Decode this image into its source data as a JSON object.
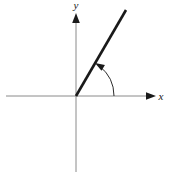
{
  "figure": {
    "background_color": "#ffffff",
    "width": 169,
    "height": 177,
    "axis_color": "#8a8a8a",
    "ray_color": "#1a1a1a",
    "arc_color": "#2b2b2b",
    "label_color": "#1a1a1a"
  },
  "axes": {
    "x_axis": {
      "label": "x",
      "label_x": 161,
      "label_y": 100,
      "start_x": 6,
      "end_x": 150,
      "y": 96,
      "arrow_tip_x": 156,
      "has_arrow": true
    },
    "y_axis": {
      "label": "y",
      "label_x": 76,
      "label_y": 9,
      "x": 76,
      "start_y": 172,
      "end_y": 20,
      "arrow_tip_y": 13,
      "has_arrow": true
    },
    "origin": {
      "x": 76,
      "y": 96,
      "label": ""
    }
  },
  "ray": {
    "name": "terminal-side",
    "from_x": 76,
    "from_y": 96,
    "to_x": 126,
    "to_y": 10,
    "stroke_width": 2.6,
    "angle_degrees": 60
  },
  "angle_arc": {
    "name": "angle-sweep-arc",
    "radius": 38,
    "start_x": 114,
    "start_y": 96,
    "end_x": 99,
    "end_y": 61,
    "start_angle_degrees": 0,
    "end_angle_degrees": 60,
    "direction": "counterclockwise",
    "stroke_width": 1,
    "has_arrowhead": true,
    "arrow_tip_x": 97,
    "arrow_tip_y": 58,
    "label": ""
  },
  "chart_data": {
    "type": "line",
    "xlabel": "x",
    "ylabel": "y",
    "grid": false,
    "legend": "none",
    "xlim": [
      -70,
      80
    ],
    "ylim": [
      -76,
      86
    ],
    "series": [
      {
        "name": "terminal-side",
        "x": [
          0,
          50
        ],
        "y": [
          0,
          86
        ]
      }
    ],
    "annotations": [
      {
        "name": "angle-sweep-arc",
        "text": "",
        "from_angle_degrees": 0,
        "to_angle_degrees": 60,
        "radius_px": 38
      }
    ]
  }
}
